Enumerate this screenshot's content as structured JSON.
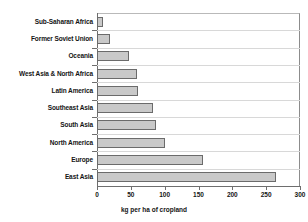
{
  "chart_data": {
    "type": "bar",
    "orientation": "horizontal",
    "title": "",
    "xlabel": "kg per ha of cropland",
    "ylabel": "",
    "xlim": [
      0,
      300
    ],
    "xticks": [
      0,
      50,
      100,
      150,
      200,
      250,
      300
    ],
    "grid": true,
    "legend": null,
    "categories": [
      "Sub-Saharan Africa",
      "Former Soviet Union",
      "Oceania",
      "West Asia & North Africa",
      "Latin America",
      "Southeast Asia",
      "South Asia",
      "North America",
      "Europe",
      "East Asia"
    ],
    "values": [
      9,
      19,
      48,
      59,
      60,
      83,
      87,
      101,
      157,
      265
    ],
    "bar_fill_color": "#c9c9c9",
    "bar_border_color": "#6b6b6b",
    "axis_color": "#6e6e6e",
    "gridline_color": "#d8d8d8",
    "background_color": "#ffffff"
  }
}
